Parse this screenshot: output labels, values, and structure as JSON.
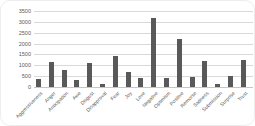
{
  "chart_data": {
    "type": "bar",
    "title": "",
    "xlabel": "",
    "ylabel": "",
    "categories": [
      "Aggressiveness",
      "Anger",
      "Anticipation",
      "Awe",
      "Disgust",
      "Disapproval",
      "Fear",
      "Joy",
      "Love",
      "Negative",
      "Optimism",
      "Positive",
      "Remorse",
      "Sadness",
      "Submission",
      "Surprise",
      "Trust"
    ],
    "values": [
      350,
      1150,
      800,
      300,
      1100,
      150,
      1450,
      700,
      400,
      3200,
      400,
      2200,
      450,
      1200,
      150,
      500,
      1250
    ],
    "ylim": [
      0,
      3500
    ],
    "yticks": [
      0,
      500,
      1000,
      1500,
      2000,
      2500,
      3000,
      3500
    ],
    "ytick_labels": [
      "0",
      "500",
      "1000",
      "1500",
      "2000",
      "2500",
      "3000",
      "3500"
    ],
    "grid": true,
    "legend": "none",
    "bar_color": "#595959",
    "gridline_color": "#d9d9d9",
    "axis_label_color": "#595959",
    "background_color": "#ffffff"
  }
}
